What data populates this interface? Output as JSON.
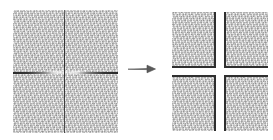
{
  "figure": {
    "background_color": "#ffffff",
    "texture_color": "#cfcfcf",
    "crack_color": "#2f2f2f",
    "arrow_color": "#555555",
    "arrow_glyph": "→",
    "source": {
      "label": "cracked textured image",
      "width_px": 105,
      "height_px": 123,
      "cracks": [
        {
          "name": "vertical-crack",
          "orientation": "vertical",
          "position_px": 51
        },
        {
          "name": "horizontal-crack-left",
          "orientation": "horizontal",
          "position_px": 62,
          "fade": "dark-at-left-edge"
        },
        {
          "name": "horizontal-crack-right",
          "orientation": "horizontal",
          "position_px": 62,
          "fade": "dark-at-right-edge"
        }
      ]
    },
    "result": {
      "label": "four separated tiles",
      "tile_width_px": 44,
      "tile_height_px": 56,
      "gap_x_px": 8,
      "gap_y_px": 7,
      "tiles": [
        {
          "name": "tile-top-left",
          "position": "top-left",
          "cut_edges": [
            "right",
            "bottom"
          ]
        },
        {
          "name": "tile-top-right",
          "position": "top-right",
          "cut_edges": [
            "left",
            "bottom"
          ]
        },
        {
          "name": "tile-bottom-left",
          "position": "bottom-left",
          "cut_edges": [
            "top",
            "right"
          ]
        },
        {
          "name": "tile-bottom-right",
          "position": "bottom-right",
          "cut_edges": [
            "top",
            "left"
          ]
        }
      ]
    }
  }
}
